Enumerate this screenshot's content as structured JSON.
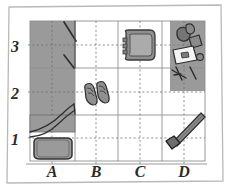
{
  "diagram": {
    "style": "sketch",
    "paper_color": "#ffffff",
    "ink_color": "#3a3a3a",
    "shade_color": "#9a9a9a",
    "grid_line_color": "#8e8e8e",
    "axes": {
      "x_label_name": "column-labels",
      "x_labels": [
        "A",
        "B",
        "C",
        "D"
      ],
      "y_label_name": "row-labels",
      "y_labels": [
        "3",
        "2",
        "1"
      ]
    },
    "grid": {
      "columns": 4,
      "rows": 4,
      "dotted": true
    },
    "zones": [
      {
        "name": "shaded-zone-a3",
        "cell": "A3",
        "fill": "#9a9a9a"
      },
      {
        "name": "shaded-zone-a2",
        "cell": "A2",
        "fill": "#9a9a9a"
      },
      {
        "name": "shaded-zone-d3-d2",
        "cell": "D3-D2",
        "fill": "#9a9a9a"
      }
    ],
    "objects": [
      {
        "name": "door-swing",
        "cell": "A3",
        "kind": "door"
      },
      {
        "name": "chair",
        "cell": "C3",
        "kind": "chair"
      },
      {
        "name": "scattered-items",
        "cell": "D3",
        "kind": "clutter"
      },
      {
        "name": "shoes-pair",
        "cell": "B2",
        "kind": "shoes"
      },
      {
        "name": "bed-blanket",
        "cell": "A2-A1",
        "kind": "bed"
      },
      {
        "name": "rug-mat",
        "cell": "A1",
        "kind": "rug"
      },
      {
        "name": "broom",
        "cell": "D1",
        "kind": "broom"
      }
    ]
  }
}
